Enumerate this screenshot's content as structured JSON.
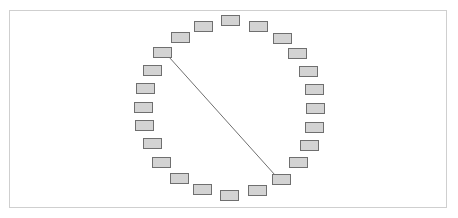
{
  "diagram": {
    "type": "ring-network",
    "node_count": 24,
    "node_size": {
      "width": 18,
      "height": 10
    },
    "colors": {
      "frame_border": "#cfcfcf",
      "node_fill": "#d3d3d3",
      "node_stroke": "#6f6f6f",
      "edge": "#4a4a4a",
      "background": "#ffffff"
    },
    "nodes": [
      {
        "id": 1,
        "x": 221,
        "y": 15
      },
      {
        "id": 2,
        "x": 249,
        "y": 21
      },
      {
        "id": 3,
        "x": 273,
        "y": 33
      },
      {
        "id": 4,
        "x": 288,
        "y": 48
      },
      {
        "id": 5,
        "x": 299,
        "y": 66
      },
      {
        "id": 6,
        "x": 305,
        "y": 84
      },
      {
        "id": 7,
        "x": 306,
        "y": 103
      },
      {
        "id": 8,
        "x": 305,
        "y": 122
      },
      {
        "id": 9,
        "x": 300,
        "y": 140
      },
      {
        "id": 10,
        "x": 289,
        "y": 157
      },
      {
        "id": 11,
        "x": 272,
        "y": 174
      },
      {
        "id": 12,
        "x": 248,
        "y": 185
      },
      {
        "id": 13,
        "x": 220,
        "y": 190
      },
      {
        "id": 14,
        "x": 193,
        "y": 184
      },
      {
        "id": 15,
        "x": 170,
        "y": 173
      },
      {
        "id": 16,
        "x": 152,
        "y": 157
      },
      {
        "id": 17,
        "x": 143,
        "y": 138
      },
      {
        "id": 18,
        "x": 135,
        "y": 120
      },
      {
        "id": 19,
        "x": 134,
        "y": 102
      },
      {
        "id": 20,
        "x": 136,
        "y": 83
      },
      {
        "id": 21,
        "x": 143,
        "y": 65
      },
      {
        "id": 22,
        "x": 153,
        "y": 47
      },
      {
        "id": 23,
        "x": 171,
        "y": 32
      },
      {
        "id": 24,
        "x": 194,
        "y": 21
      }
    ],
    "edges": [
      {
        "from": 22,
        "to": 11,
        "x1": 169,
        "y1": 57,
        "x2": 275,
        "y2": 175
      }
    ]
  }
}
